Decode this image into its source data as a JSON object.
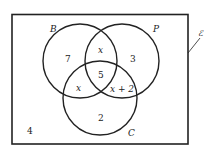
{
  "diagram": {
    "type": "venn",
    "universal_symbol": "ℰ",
    "sets": [
      {
        "name": "B",
        "cx": 80,
        "cy": 61,
        "r": 37
      },
      {
        "name": "P",
        "cx": 122,
        "cy": 61,
        "r": 37
      },
      {
        "name": "C",
        "cx": 100,
        "cy": 98,
        "r": 37
      }
    ],
    "regions": {
      "B_only": "7",
      "B_and_P_only": "x",
      "P_only": "3",
      "B_P_C": "5",
      "B_and_C_only": "x",
      "P_and_C_only": "x + 2",
      "C_only": "2",
      "outside": "4"
    },
    "labels": {
      "B": "B",
      "P": "P",
      "C": "C",
      "universal": "ℰ"
    }
  }
}
